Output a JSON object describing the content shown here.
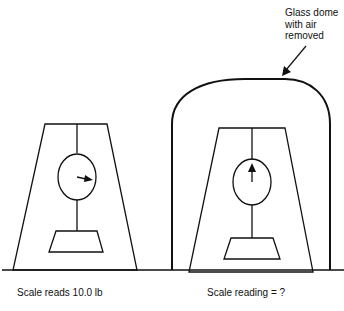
{
  "diagram": {
    "annotation": {
      "dome_label": "Glass dome with air removed"
    },
    "left_scale": {
      "caption": "Scale reads 10.0 lb",
      "needle_direction": "right",
      "reading_lb": 10.0
    },
    "right_scale": {
      "caption": "Scale reading = ?",
      "needle_direction": "up",
      "enclosed_by": "glass dome (vacuum)"
    },
    "colors": {
      "stroke": "#111111",
      "background": "#ffffff"
    }
  }
}
